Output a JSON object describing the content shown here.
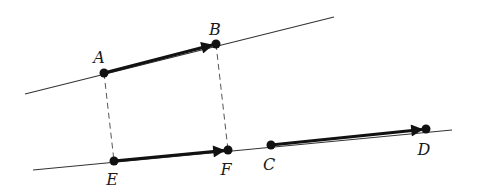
{
  "colors": {
    "background": "#ffffff",
    "ink": "#111111",
    "thin_line": "#333333",
    "dashed": "#555555"
  },
  "lines": [
    {
      "id": "line-AB",
      "x1": 25,
      "y1": 94,
      "x2": 334,
      "y2": 17
    },
    {
      "id": "line-EFCD",
      "x1": 33,
      "y1": 170,
      "x2": 452,
      "y2": 130
    }
  ],
  "dashed": [
    {
      "id": "dash-AE",
      "from": "A",
      "to": "E"
    },
    {
      "id": "dash-BF",
      "from": "B",
      "to": "F"
    }
  ],
  "vectors": [
    {
      "id": "vec-AB",
      "from": "A",
      "to": "B"
    },
    {
      "id": "vec-EF",
      "from": "E",
      "to": "F"
    },
    {
      "id": "vec-CD",
      "from": "C",
      "to": "D"
    }
  ],
  "points": {
    "A": {
      "x": 104,
      "y": 73,
      "label": "A",
      "lx": 99,
      "ly": 58
    },
    "B": {
      "x": 216,
      "y": 44,
      "label": "B",
      "lx": 215,
      "ly": 30
    },
    "E": {
      "x": 114,
      "y": 161,
      "label": "E",
      "lx": 112,
      "ly": 180
    },
    "F": {
      "x": 228,
      "y": 150,
      "label": "F",
      "lx": 226,
      "ly": 170
    },
    "C": {
      "x": 271,
      "y": 145,
      "label": "C",
      "lx": 269,
      "ly": 165
    },
    "D": {
      "x": 426,
      "y": 129,
      "label": "D",
      "lx": 424,
      "ly": 150
    }
  }
}
